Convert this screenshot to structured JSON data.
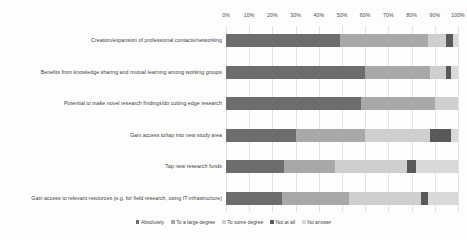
{
  "chart_data": {
    "type": "bar",
    "orientation": "horizontal",
    "stacked": true,
    "normalized_percent": true,
    "title": "",
    "subtitle": "",
    "xlabel": "",
    "ylabel": "",
    "xlim": [
      0,
      100
    ],
    "xticks": [
      "0%",
      "10%",
      "20%",
      "30%",
      "40%",
      "50%",
      "60%",
      "70%",
      "80%",
      "90%",
      "100%"
    ],
    "xtick_values": [
      0,
      10,
      20,
      30,
      40,
      50,
      60,
      70,
      80,
      90,
      100
    ],
    "grid": true,
    "grid_axis": "x",
    "legend_position": "bottom",
    "categories": [
      "Creation/expansion of professional contacts/networking",
      "Benefits from knowledge sharing and mutual learning among working groups",
      "Potential to make novel research findings/do cutting edge research",
      "Gain access to/tap into new study area",
      "Tap new research funds",
      "Gain access to relevant resources (e.g. for field research, using IT-infrastructure)"
    ],
    "series": [
      {
        "name": "Absolutely",
        "color": "#6d6d6d",
        "values": [
          49,
          60,
          58,
          30,
          25,
          24
        ]
      },
      {
        "name": "To a large degree",
        "color": "#a8a8a8",
        "values": [
          38,
          28,
          32,
          30,
          22,
          29
        ]
      },
      {
        "name": "To some degree",
        "color": "#cfcfcf",
        "values": [
          8,
          7,
          10,
          28,
          31,
          31
        ]
      },
      {
        "name": "Not at all",
        "color": "#595959",
        "values": [
          3,
          2,
          0,
          9,
          4,
          3
        ]
      },
      {
        "name": "No answer",
        "color": "#d9d9d9",
        "values": [
          2,
          3,
          0,
          3,
          18,
          13
        ]
      }
    ]
  },
  "legend": {
    "items": [
      {
        "label": "Absolutely",
        "color": "#6d6d6d"
      },
      {
        "label": "To a large degree",
        "color": "#a8a8a8"
      },
      {
        "label": "To some degree",
        "color": "#cfcfcf"
      },
      {
        "label": "Not at all",
        "color": "#595959"
      },
      {
        "label": "No answer",
        "color": "#d9d9d9"
      }
    ]
  }
}
